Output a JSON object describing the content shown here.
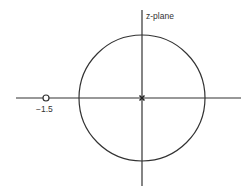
{
  "diagram": {
    "title": "z-plane",
    "zero_label": "−1.5",
    "unit_circle": {
      "cx": 142,
      "cy": 98,
      "r": 63
    },
    "zero": {
      "value": -1.5,
      "x": 46,
      "y": 98
    },
    "pole": {
      "value": 0,
      "x": 142,
      "y": 98
    },
    "colors": {
      "stroke": "#333333",
      "background": "#ffffff"
    }
  }
}
